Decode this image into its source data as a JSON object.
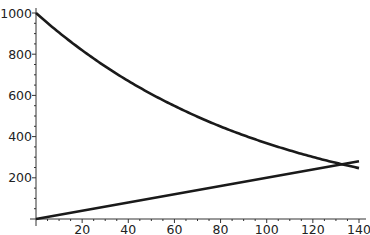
{
  "chart_data": {
    "type": "line",
    "title": "",
    "xlabel": "",
    "ylabel": "",
    "xlim": [
      0,
      142
    ],
    "ylim": [
      0,
      1000
    ],
    "grid": false,
    "legend": null,
    "x_ticks": [
      20,
      40,
      60,
      80,
      100,
      120,
      140
    ],
    "y_ticks": [
      200,
      400,
      600,
      800,
      1000
    ],
    "x_tick_labels": [
      "20",
      "40",
      "60",
      "80",
      "100",
      "120",
      "140"
    ],
    "y_tick_labels": [
      "200",
      "400",
      "600",
      "800",
      "1000"
    ],
    "series": [
      {
        "name": "decreasing",
        "x": [
          0,
          20,
          40,
          60,
          80,
          100,
          120,
          140
        ],
        "values": [
          1000,
          819,
          670,
          549,
          449,
          368,
          301,
          247
        ]
      },
      {
        "name": "increasing",
        "x": [
          0,
          20,
          40,
          60,
          80,
          100,
          120,
          140
        ],
        "values": [
          0,
          40,
          80,
          120,
          160,
          200,
          240,
          280
        ]
      }
    ],
    "annotations": [
      {
        "type": "intersection",
        "x": 132,
        "y": 264
      }
    ],
    "line_color": "#1a1a1a"
  }
}
